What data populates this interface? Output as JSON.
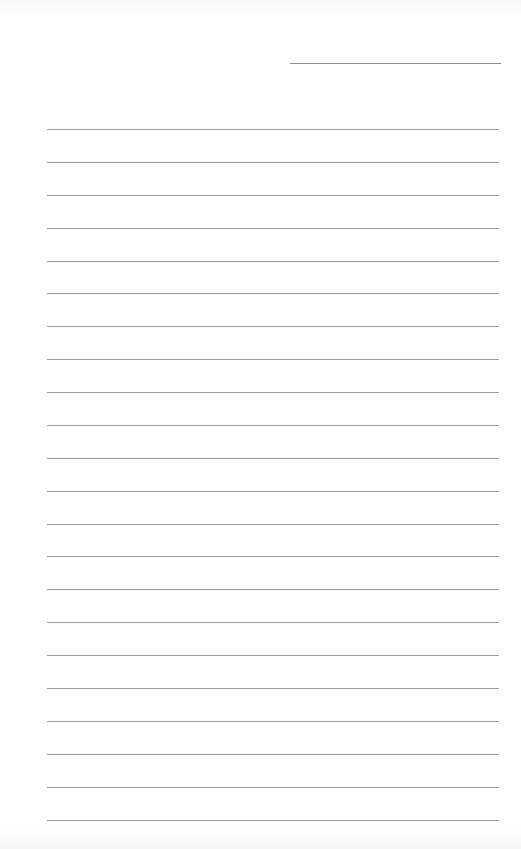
{
  "page": {
    "type": "blank lined paper",
    "background": "#fefefe",
    "line_color": "#9a9a9a",
    "header_line": {
      "present": true
    },
    "ruled_lines": {
      "count": 22
    }
  }
}
